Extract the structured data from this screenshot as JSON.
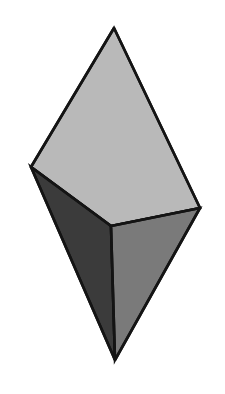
{
  "figure": {
    "name": "bipyramid-solid",
    "background_color": "#ffffff",
    "outline_color": "#141414",
    "outline_width": 2.6,
    "canvas": {
      "width": 225,
      "height": 394
    },
    "vertices": {
      "top_apex": {
        "label": "top apex",
        "x": 114,
        "y": 28
      },
      "left": {
        "label": "left vertex",
        "x": 31,
        "y": 167
      },
      "right": {
        "label": "right vertex",
        "x": 200,
        "y": 208
      },
      "center": {
        "label": "center triple point",
        "x": 111,
        "y": 226
      },
      "bottom_apex": {
        "label": "bottom apex",
        "x": 115,
        "y": 360
      }
    },
    "faces": [
      {
        "name": "top-face",
        "label": "Upper light face",
        "fill": "#b9b9b9",
        "points": "114,28 31,167 111,226 200,208"
      },
      {
        "name": "left-face",
        "label": "Lower-left dark face",
        "fill": "#3b3b3b",
        "points": "31,167 115,360 111,226"
      },
      {
        "name": "right-face",
        "label": "Lower-right medium face",
        "fill": "#7a7a7a",
        "points": "111,226 115,360 200,208"
      }
    ],
    "edges": [
      {
        "name": "edge-top-apex-to-left",
        "points": "114,28 31,167"
      },
      {
        "name": "edge-top-apex-to-right",
        "points": "114,28 200,208"
      },
      {
        "name": "edge-left-to-center",
        "points": "31,167 111,226"
      },
      {
        "name": "edge-right-to-center",
        "points": "200,208 111,226"
      },
      {
        "name": "edge-center-to-bottom",
        "points": "111,226 115,360"
      },
      {
        "name": "edge-left-to-bottom",
        "points": "31,167 115,360"
      },
      {
        "name": "edge-right-to-bottom",
        "points": "200,208 115,360"
      }
    ]
  }
}
